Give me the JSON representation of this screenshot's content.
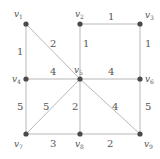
{
  "diagram": {
    "type": "weighted-undirected-graph",
    "colors": {
      "edge": "#b8b8b8",
      "node": "#4a4a4a",
      "text": "#555555",
      "background": "#ffffff"
    },
    "nodes": [
      {
        "id": "v1",
        "base": "v",
        "sub": "1",
        "x": 26,
        "y": 24
      },
      {
        "id": "v2",
        "base": "v",
        "sub": "2",
        "x": 80,
        "y": 24
      },
      {
        "id": "v3",
        "base": "v",
        "sub": "3",
        "x": 140,
        "y": 24
      },
      {
        "id": "v4",
        "base": "v",
        "sub": "4",
        "x": 26,
        "y": 79
      },
      {
        "id": "v5",
        "base": "v",
        "sub": "5",
        "x": 80,
        "y": 79
      },
      {
        "id": "v6",
        "base": "v",
        "sub": "6",
        "x": 140,
        "y": 79
      },
      {
        "id": "v7",
        "base": "v",
        "sub": "7",
        "x": 26,
        "y": 134
      },
      {
        "id": "v8",
        "base": "v",
        "sub": "8",
        "x": 80,
        "y": 134
      },
      {
        "id": "v9",
        "base": "v",
        "sub": "9",
        "x": 140,
        "y": 134
      }
    ],
    "edges": [
      {
        "from": "v2",
        "to": "v3",
        "weight": "1"
      },
      {
        "from": "v1",
        "to": "v4",
        "weight": "1"
      },
      {
        "from": "v1",
        "to": "v5",
        "weight": "2"
      },
      {
        "from": "v2",
        "to": "v5",
        "weight": "1"
      },
      {
        "from": "v3",
        "to": "v6",
        "weight": "1"
      },
      {
        "from": "v4",
        "to": "v5",
        "weight": "4"
      },
      {
        "from": "v5",
        "to": "v6",
        "weight": "4"
      },
      {
        "from": "v4",
        "to": "v7",
        "weight": "5"
      },
      {
        "from": "v5",
        "to": "v7",
        "weight": "5"
      },
      {
        "from": "v5",
        "to": "v8",
        "weight": "2"
      },
      {
        "from": "v5",
        "to": "v9",
        "weight": "4"
      },
      {
        "from": "v6",
        "to": "v9",
        "weight": "5"
      },
      {
        "from": "v7",
        "to": "v8",
        "weight": "3"
      },
      {
        "from": "v8",
        "to": "v9",
        "weight": "2"
      }
    ]
  }
}
